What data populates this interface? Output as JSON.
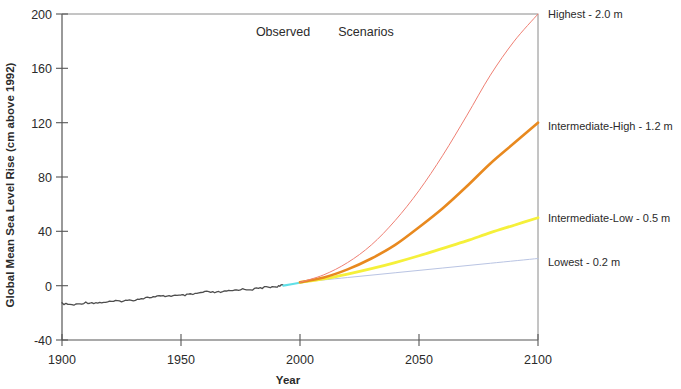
{
  "chart_data": {
    "type": "line",
    "title": "",
    "xlabel": "Year",
    "ylabel": "Global Mean Sea Level Rise (cm above 1992)",
    "xlim": [
      1900,
      2100
    ],
    "ylim": [
      -40,
      200
    ],
    "xticks": [
      1900,
      1950,
      2000,
      2050,
      2100
    ],
    "xtick_labels": [
      "1900",
      "1950",
      "2000",
      "2050",
      "2100"
    ],
    "yticks": [
      -40,
      0,
      40,
      80,
      120,
      160,
      200
    ],
    "ytick_labels": [
      "-40",
      "0",
      "40",
      "80",
      "120",
      "160",
      "200"
    ],
    "grid": false,
    "legend_position": "right-of-axes-inline",
    "annotations": [
      {
        "text": "Observed",
        "x": 1957,
        "y": 190
      },
      {
        "text": "Scenarios",
        "x": 1988,
        "y": 190
      }
    ],
    "series": [
      {
        "name": "Observed",
        "color": "#4d4d4d",
        "linewidth": 1.3,
        "x": [
          1900,
          1905,
          1910,
          1915,
          1920,
          1925,
          1930,
          1935,
          1940,
          1945,
          1950,
          1955,
          1960,
          1965,
          1970,
          1975,
          1980,
          1985,
          1990,
          1993
        ],
        "values": [
          -14.0,
          -13.6,
          -13.1,
          -12.6,
          -12.0,
          -11.3,
          -10.4,
          -9.4,
          -8.3,
          -7.4,
          -6.6,
          -5.9,
          -5.1,
          -4.3,
          -3.6,
          -2.8,
          -2.1,
          -1.4,
          -0.5,
          0.0
        ]
      },
      {
        "name": "Satellite transition",
        "color": "#5fe0e8",
        "linewidth": 2.2,
        "x": [
          1993,
          1997,
          2001,
          2005
        ],
        "values": [
          0.0,
          1.2,
          2.5,
          3.8
        ]
      },
      {
        "name": "Highest - 2.0 m",
        "label": "Highest - 2.0 m",
        "color": "#ef7f73",
        "linewidth": 1.0,
        "x": [
          2000,
          2010,
          2020,
          2030,
          2040,
          2050,
          2060,
          2070,
          2080,
          2090,
          2100
        ],
        "values": [
          2.5,
          8,
          17,
          30,
          48,
          70,
          96,
          125,
          155,
          180,
          200
        ],
        "endpoint_value": 200
      },
      {
        "name": "Intermediate-High - 1.2 m",
        "label": "Intermediate-High - 1.2 m",
        "color": "#e8891f",
        "linewidth": 2.6,
        "x": [
          2000,
          2010,
          2020,
          2030,
          2040,
          2050,
          2060,
          2070,
          2080,
          2090,
          2100
        ],
        "values": [
          2.5,
          6,
          12,
          20,
          30,
          43,
          57,
          73,
          90,
          105,
          120
        ],
        "endpoint_value": 120
      },
      {
        "name": "Intermediate-Low - 0.5 m",
        "label": "Intermediate-Low - 0.5 m",
        "color": "#f5f03a",
        "linewidth": 2.8,
        "x": [
          2000,
          2010,
          2020,
          2030,
          2040,
          2050,
          2060,
          2070,
          2080,
          2090,
          2100
        ],
        "values": [
          2.5,
          5,
          8.5,
          12.5,
          17,
          22,
          27.5,
          33,
          39,
          44.5,
          50
        ],
        "endpoint_value": 50
      },
      {
        "name": "Lowest - 0.2 m",
        "label": "Lowest - 0.2 m",
        "color": "#b9c4e3",
        "linewidth": 1.0,
        "x": [
          2000,
          2020,
          2040,
          2060,
          2080,
          2100
        ],
        "values": [
          2.5,
          6,
          9.5,
          13,
          16.5,
          20
        ],
        "endpoint_value": 20
      }
    ]
  },
  "labels": {
    "y_axis_title": "Global Mean Sea Level Rise (cm above 1992)",
    "x_axis_title": "Year",
    "observed_annotation": "Observed",
    "scenarios_annotation": "Scenarios",
    "ytick_200": "200",
    "ytick_160": "160",
    "ytick_120": "120",
    "ytick_80": "80",
    "ytick_40": "40",
    "ytick_0": "0",
    "ytick_m40": "-40",
    "xtick_1900": "1900",
    "xtick_1950": "1950",
    "xtick_2000": "2000",
    "xtick_2050": "2050",
    "xtick_2100": "2100",
    "series_label_highest": "Highest - 2.0 m",
    "series_label_inter_high": "Intermediate-High - 1.2 m",
    "series_label_inter_low": "Intermediate-Low - 0.5 m",
    "series_label_lowest": "Lowest - 0.2 m"
  },
  "colors": {
    "axis": "#555555",
    "observed": "#4d4d4d",
    "satellite": "#5fe0e8",
    "highest": "#ef7f73",
    "intermediate_high": "#e8891f",
    "intermediate_low": "#f5f03a",
    "lowest": "#b9c4e3",
    "text": "#2b2b2b"
  }
}
